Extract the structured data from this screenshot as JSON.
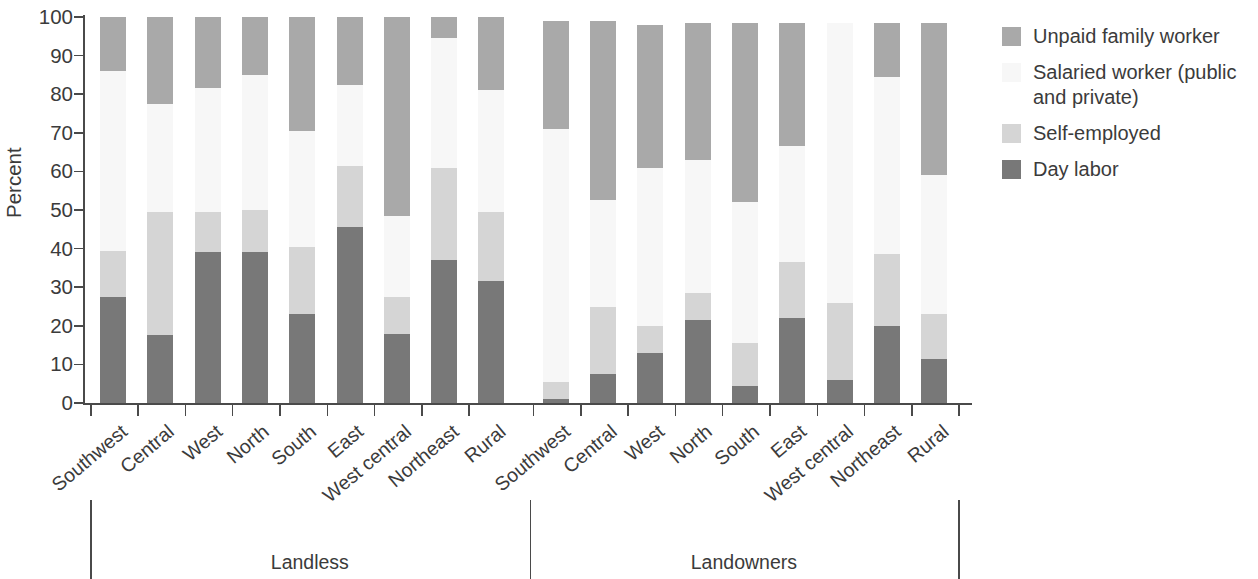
{
  "chart_data": {
    "type": "bar",
    "subtype": "stacked-bar-100-percent",
    "title": "",
    "xlabel": "",
    "ylabel": "Percent",
    "ylim": [
      0,
      100
    ],
    "yticks": [
      0,
      10,
      20,
      30,
      40,
      50,
      60,
      70,
      80,
      90,
      100
    ],
    "grid": false,
    "legend_position": "right",
    "groups": [
      "Landless",
      "Landowners"
    ],
    "categories": [
      "Southwest",
      "Central",
      "West",
      "North",
      "South",
      "East",
      "West central",
      "Northeast",
      "Rural",
      "Southwest",
      "Central",
      "West",
      "North",
      "South",
      "East",
      "West central",
      "Northeast",
      "Rural"
    ],
    "group_of_category": [
      "Landless",
      "Landless",
      "Landless",
      "Landless",
      "Landless",
      "Landless",
      "Landless",
      "Landless",
      "Landless",
      "Landowners",
      "Landowners",
      "Landowners",
      "Landowners",
      "Landowners",
      "Landowners",
      "Landowners",
      "Landowners",
      "Landowners"
    ],
    "series": [
      {
        "name": "Day labor",
        "color": "#787878",
        "values": [
          27.5,
          17.5,
          39.0,
          39.0,
          23.0,
          45.5,
          18.0,
          37.0,
          31.5,
          1.0,
          7.5,
          13.0,
          21.5,
          4.5,
          22.0,
          6.0,
          20.0,
          11.5
        ]
      },
      {
        "name": "Self-employed",
        "color": "#d5d5d5",
        "values": [
          12.0,
          32.0,
          10.5,
          11.0,
          17.5,
          16.0,
          9.5,
          24.0,
          18.0,
          4.5,
          17.5,
          7.0,
          7.0,
          11.0,
          14.5,
          20.0,
          18.5,
          11.5
        ]
      },
      {
        "name": "Salaried worker (public and private)",
        "color": "#f7f7f7",
        "values": [
          46.5,
          28.0,
          32.0,
          35.0,
          30.0,
          21.0,
          21.0,
          33.5,
          31.5,
          65.5,
          27.5,
          41.0,
          34.5,
          36.5,
          30.0,
          72.5,
          46.0,
          36.0
        ]
      },
      {
        "name": "Unpaid family worker",
        "color": "#a9a9a9",
        "values": [
          14.0,
          22.5,
          18.5,
          15.0,
          29.5,
          17.5,
          51.5,
          5.5,
          19.0,
          28.0,
          46.5,
          37.0,
          35.5,
          46.5,
          32.0,
          0.0,
          14.0,
          39.5
        ]
      }
    ],
    "series_tops": {
      "note": "cumulative top of each stack per category",
      "day_labor": [
        27.5,
        17.5,
        39.0,
        39.0,
        23.0,
        45.5,
        18.0,
        37.0,
        31.5,
        1.0,
        7.5,
        13.0,
        21.5,
        4.5,
        22.0,
        6.0,
        20.0,
        11.5
      ],
      "self_employed": [
        39.5,
        49.5,
        49.5,
        50.0,
        40.5,
        61.5,
        27.5,
        61.0,
        49.5,
        5.5,
        25.0,
        20.0,
        28.5,
        15.5,
        36.5,
        26.0,
        38.5,
        23.0
      ],
      "salaried": [
        86.0,
        77.5,
        81.5,
        85.0,
        70.5,
        82.5,
        48.5,
        94.5,
        81.0,
        71.0,
        52.5,
        61.0,
        63.0,
        52.0,
        66.5,
        98.5,
        84.5,
        59.0
      ],
      "unpaid": [
        100.0,
        100.0,
        100.0,
        100.0,
        100.0,
        100.0,
        100.0,
        100.0,
        100.0,
        99.0,
        99.0,
        98.5,
        98.5,
        98.5,
        98.5,
        98.5,
        98.5,
        98.5
      ]
    }
  },
  "legend": {
    "items": [
      {
        "label": "Unpaid family worker",
        "color": "#a9a9a9"
      },
      {
        "label": "Salaried worker (public and private)",
        "color": "#f7f7f7"
      },
      {
        "label": "Self-employed",
        "color": "#d5d5d5"
      },
      {
        "label": "Day labor",
        "color": "#787878"
      }
    ]
  },
  "axes": {
    "y_title": "Percent",
    "y_tick_labels": [
      "100",
      "90",
      "80",
      "70",
      "60",
      "50",
      "40",
      "30",
      "20",
      "10",
      "0"
    ]
  },
  "group_labels": [
    {
      "label": "Landless"
    },
    {
      "label": "Landowners"
    }
  ]
}
